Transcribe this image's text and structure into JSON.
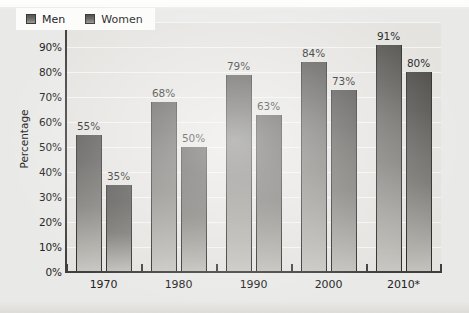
{
  "chart_data": {
    "type": "bar",
    "title": "",
    "subtitle": "",
    "xlabel": "",
    "ylabel": "Percentage",
    "categories": [
      "1970",
      "1980",
      "1990",
      "2000",
      "2010*"
    ],
    "series": [
      {
        "name": "Men",
        "values": [
          55,
          68,
          79,
          84,
          91
        ],
        "value_labels": [
          "55%",
          "68%",
          "79%",
          "84%",
          "91%"
        ]
      },
      {
        "name": "Women",
        "values": [
          35,
          50,
          63,
          73,
          80
        ],
        "value_labels": [
          "35%",
          "50%",
          "63%",
          "73%",
          "80%"
        ]
      }
    ],
    "ylim": [
      0,
      100
    ],
    "ytick_values": [
      0,
      10,
      20,
      30,
      40,
      50,
      60,
      70,
      80,
      90,
      100
    ],
    "ytick_labels": [
      "0%",
      "10%",
      "20%",
      "30%",
      "40%",
      "50%",
      "60%",
      "70%",
      "80%",
      "90%",
      "100%"
    ],
    "grid": true,
    "grid_axis": "y",
    "legend": [
      "Men",
      "Women"
    ],
    "legend_position": "top-left-inside",
    "annotations": [
      "* value for 2010 is marked with an asterisk"
    ],
    "colors": {
      "men_bar_top": "#555451",
      "men_bar_bottom": "#c9c8c3",
      "women_bar_top": "#4e4d4a",
      "women_bar_bottom": "#c4c3be",
      "plot_background": "#e4e3e0",
      "page_background": "#e9e9e7",
      "gridline": "#f4f4f2",
      "axis": "#3f3f3f",
      "text": "#232323"
    }
  },
  "legend": {
    "men_label": "Men",
    "women_label": "Women"
  },
  "axes": {
    "y_title": "Percentage"
  }
}
